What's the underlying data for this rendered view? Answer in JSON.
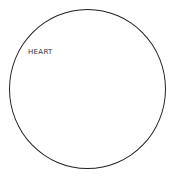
{
  "diagram": {
    "shape": "circle",
    "label": "HEART",
    "colors": {
      "stroke": "#222222",
      "text": "#333333",
      "background": "#ffffff"
    }
  }
}
